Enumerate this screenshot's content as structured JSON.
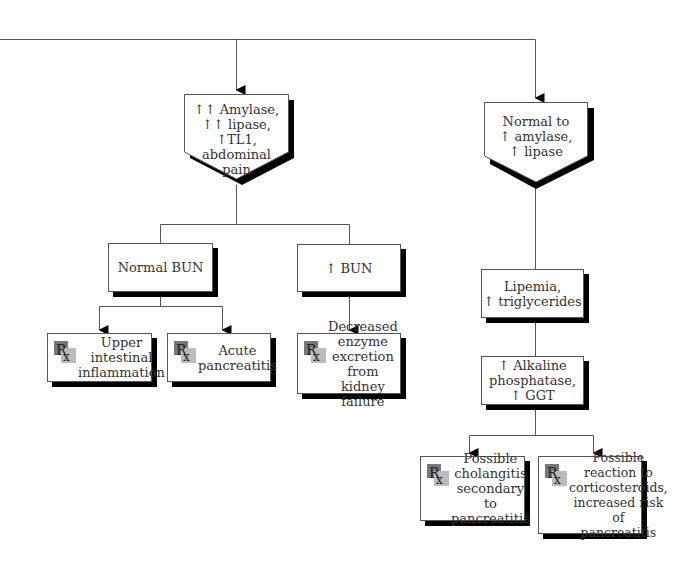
{
  "diagram": {
    "type": "flowchart",
    "branches": [
      {
        "id": "left",
        "header": {
          "lines": [
            "↑↑ Amylase,",
            "↑↑ lipase,",
            "↑TL1,",
            "abdominal",
            "pain"
          ]
        },
        "subbranches": [
          {
            "label": "Normal BUN",
            "outcomes": [
              {
                "icon": "rx-icon",
                "lines": [
                  "Upper",
                  "intestinal",
                  "inflammation"
                ]
              },
              {
                "icon": "rx-icon",
                "lines": [
                  "Acute",
                  "pancreatitis"
                ]
              }
            ]
          },
          {
            "label": "↑ BUN",
            "outcomes": [
              {
                "icon": "rx-icon",
                "lines": [
                  "Decreased",
                  "enzyme",
                  "excretion from",
                  "kidney failure"
                ]
              }
            ]
          }
        ]
      },
      {
        "id": "right",
        "header": {
          "lines": [
            "Normal to",
            "↑ amylase,",
            "↑ lipase"
          ]
        },
        "steps": [
          {
            "lines": [
              "Lipemia,",
              "↑ triglycerides"
            ]
          },
          {
            "lines": [
              "↑ Alkaline",
              "phosphatase,",
              "↑ GGT"
            ]
          }
        ],
        "outcomes": [
          {
            "icon": "rx-icon",
            "lines": [
              "Possible",
              "cholangitis",
              "secondary to",
              "pancreatitis"
            ]
          },
          {
            "icon": "rx-icon",
            "lines": [
              "Possible",
              "reaction to",
              "corticosteroids,",
              "increased risk of",
              "pancreatitis"
            ]
          }
        ]
      }
    ],
    "colors": {
      "line": "#555555",
      "shadow": "#000000",
      "text": "#333333",
      "box_fill": "#ffffff"
    }
  },
  "labels": {
    "left_header": "↑↑ Amylase,\n↑↑ lipase,\n↑TL1,\nabdominal\npain",
    "right_header": "Normal to\n↑ amylase,\n↑ lipase",
    "normal_bun": "Normal BUN",
    "up_bun": "↑ BUN",
    "upper_intestinal": "Upper intestinal inflammation",
    "acute_pancreatitis": "Acute pancreatitis",
    "decreased_enzyme": "Decreased enzyme excretion from kidney failure",
    "lipemia": "Lipemia, ↑ triglycerides",
    "alkaline": "↑ Alkaline phosphatase, ↑ GGT",
    "cholangitis": "Possible cholangitis secondary to pancreatitis",
    "corticosteroids": "Possible reaction to corticosteroids, increased risk of pancreatitis"
  }
}
